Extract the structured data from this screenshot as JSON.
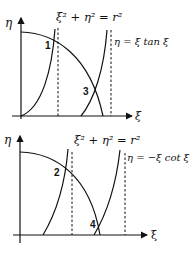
{
  "panels": [
    {
      "id": "top",
      "y_axis_label": "η",
      "x_axis_label": "ξ",
      "circle_equation": "ξ² + η² = r²",
      "curve_equation": "η = ξ tan ξ",
      "intersections": [
        "1",
        "3"
      ]
    },
    {
      "id": "bottom",
      "y_axis_label": "η",
      "x_axis_label": "ξ",
      "circle_equation": "ξ² + η² = r²",
      "curve_equation": "η = −ξ cot ξ",
      "intersections": [
        "2",
        "4"
      ]
    }
  ],
  "colors": {
    "stroke": "#111111",
    "background": "#ffffff"
  }
}
